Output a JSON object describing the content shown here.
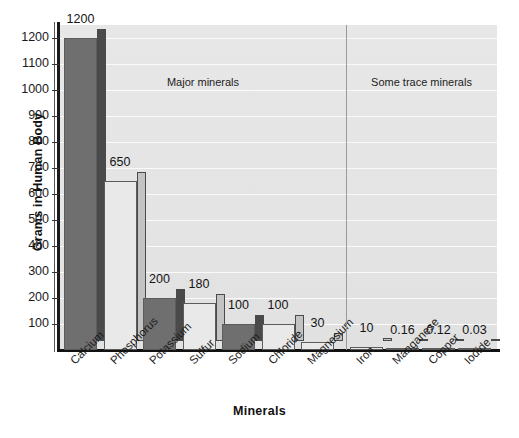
{
  "chart_data": {
    "type": "bar",
    "title": "",
    "xlabel": "Minerals",
    "ylabel": "Grams in Human Body",
    "ylim": [
      0,
      1250
    ],
    "grid": true,
    "legend": "none",
    "ytick_labels": [
      "1200",
      "1100",
      "1000",
      "900",
      "800",
      "700",
      "600",
      "500",
      "400",
      "300",
      "200",
      "100"
    ],
    "ytick_values": [
      1200,
      1100,
      1000,
      900,
      800,
      700,
      600,
      500,
      400,
      300,
      200,
      100
    ],
    "categories": [
      "Calcium",
      "Phosphorus",
      "Potassium",
      "Sulfur",
      "Sodium",
      "Chloride",
      "Magnesium",
      "Iron",
      "Manganese",
      "Copper",
      "Iodide"
    ],
    "values": [
      1200,
      650,
      200,
      180,
      100,
      100,
      30,
      10,
      0.16,
      0.12,
      0.03
    ],
    "value_labels": [
      "1200",
      "650",
      "200",
      "180",
      "100",
      "100",
      "30",
      "10",
      "0.16",
      "0.12",
      "0.03"
    ],
    "bar_styles": [
      "dark",
      "light",
      "dark",
      "light",
      "dark",
      "light",
      "light",
      "light",
      "light",
      "light",
      "light"
    ],
    "annotations": [
      {
        "text": "Major minerals",
        "group": "major"
      },
      {
        "text": "Some trace minerals",
        "group": "trace"
      }
    ],
    "groups": {
      "major": [
        "Calcium",
        "Phosphorus",
        "Potassium",
        "Sulfur",
        "Sodium",
        "Chloride",
        "Magnesium"
      ],
      "trace": [
        "Iron",
        "Manganese",
        "Copper",
        "Iodide"
      ]
    },
    "colors": {
      "bar_dark": "#6f6f6f",
      "bar_dark_side": "#4a4a4a",
      "bar_light": "#e9e9e9",
      "bar_light_side": "#c3c3c3",
      "plot_background": "#e4e4e4",
      "gridline": "#fafafa",
      "axis": "#111111",
      "divider": "#9a9a9a"
    }
  }
}
